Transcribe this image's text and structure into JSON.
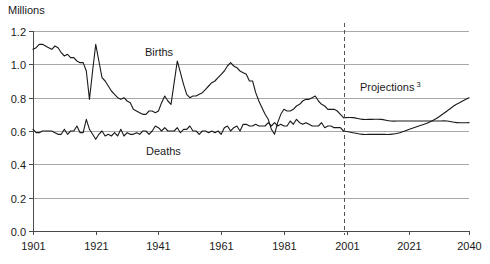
{
  "chart_data": {
    "type": "line",
    "title": "",
    "ylabel": "Millions",
    "xlabel": "",
    "ylim": [
      0.0,
      1.2
    ],
    "xlim": [
      1901,
      2040
    ],
    "grid": true,
    "legend_position": "inline-annotations",
    "y_ticks": [
      "0.0",
      "0.2",
      "0.4",
      "0.6",
      "0.8",
      "1.0",
      "1.2"
    ],
    "y_tick_values": [
      0.0,
      0.2,
      0.4,
      0.6,
      0.8,
      1.0,
      1.2
    ],
    "x_ticks": [
      "1901",
      "1921",
      "1941",
      "1961",
      "1981",
      "2001",
      "2021",
      "2040"
    ],
    "x_tick_values": [
      1901,
      1921,
      1941,
      1961,
      1981,
      2001,
      2021,
      2040
    ],
    "annotations": [
      {
        "text": "Births",
        "x": 1945,
        "y": 1.06
      },
      {
        "text": "Deaths",
        "x": 1942,
        "y": 0.47
      },
      {
        "text": "Projections",
        "superscript": "3",
        "x": 2008,
        "y": 0.83
      }
    ],
    "projection_divider": {
      "x": 2000,
      "style": "dashed"
    },
    "series": [
      {
        "name": "Births",
        "color": "#1a1a1a",
        "x": [
          1901,
          1902,
          1903,
          1904,
          1905,
          1906,
          1907,
          1908,
          1909,
          1910,
          1911,
          1912,
          1913,
          1914,
          1915,
          1916,
          1917,
          1918,
          1919,
          1920,
          1921,
          1922,
          1923,
          1924,
          1925,
          1926,
          1927,
          1928,
          1929,
          1930,
          1931,
          1932,
          1933,
          1934,
          1935,
          1936,
          1937,
          1938,
          1939,
          1940,
          1941,
          1942,
          1943,
          1944,
          1945,
          1946,
          1947,
          1948,
          1949,
          1950,
          1951,
          1952,
          1953,
          1954,
          1955,
          1956,
          1957,
          1958,
          1959,
          1960,
          1961,
          1962,
          1963,
          1964,
          1965,
          1966,
          1967,
          1968,
          1969,
          1970,
          1971,
          1972,
          1973,
          1974,
          1975,
          1976,
          1977,
          1978,
          1979,
          1980,
          1981,
          1982,
          1983,
          1984,
          1985,
          1986,
          1987,
          1988,
          1989,
          1990,
          1991,
          1992,
          1993,
          1994,
          1995,
          1996,
          1997,
          1998,
          1999,
          2000
        ],
        "values": [
          1.09,
          1.1,
          1.12,
          1.12,
          1.11,
          1.1,
          1.09,
          1.11,
          1.1,
          1.07,
          1.05,
          1.06,
          1.04,
          1.04,
          1.02,
          1.01,
          1.01,
          0.96,
          0.79,
          0.96,
          1.12,
          1.02,
          0.92,
          0.9,
          0.87,
          0.84,
          0.82,
          0.8,
          0.79,
          0.8,
          0.78,
          0.77,
          0.73,
          0.72,
          0.71,
          0.7,
          0.7,
          0.72,
          0.72,
          0.71,
          0.72,
          0.77,
          0.81,
          0.78,
          0.76,
          0.89,
          1.02,
          0.95,
          0.88,
          0.82,
          0.8,
          0.81,
          0.81,
          0.82,
          0.83,
          0.85,
          0.87,
          0.89,
          0.9,
          0.92,
          0.94,
          0.96,
          0.99,
          1.01,
          0.99,
          0.98,
          0.96,
          0.95,
          0.94,
          0.9,
          0.9,
          0.83,
          0.78,
          0.74,
          0.7,
          0.67,
          0.61,
          0.58,
          0.65,
          0.7,
          0.73,
          0.72,
          0.72,
          0.73,
          0.75,
          0.76,
          0.78,
          0.79,
          0.79,
          0.8,
          0.81,
          0.78,
          0.76,
          0.75,
          0.73,
          0.73,
          0.73,
          0.72,
          0.7,
          0.68
        ]
      },
      {
        "name": "Deaths",
        "color": "#1a1a1a",
        "x": [
          1901,
          1902,
          1903,
          1904,
          1905,
          1906,
          1907,
          1908,
          1909,
          1910,
          1911,
          1912,
          1913,
          1914,
          1915,
          1916,
          1917,
          1918,
          1919,
          1920,
          1921,
          1922,
          1923,
          1924,
          1925,
          1926,
          1927,
          1928,
          1929,
          1930,
          1931,
          1932,
          1933,
          1934,
          1935,
          1936,
          1937,
          1938,
          1939,
          1940,
          1941,
          1942,
          1943,
          1944,
          1945,
          1946,
          1947,
          1948,
          1949,
          1950,
          1951,
          1952,
          1953,
          1954,
          1955,
          1956,
          1957,
          1958,
          1959,
          1960,
          1961,
          1962,
          1963,
          1964,
          1965,
          1966,
          1967,
          1968,
          1969,
          1970,
          1971,
          1972,
          1973,
          1974,
          1975,
          1976,
          1977,
          1978,
          1979,
          1980,
          1981,
          1982,
          1983,
          1984,
          1985,
          1986,
          1987,
          1988,
          1989,
          1990,
          1991,
          1992,
          1993,
          1994,
          1995,
          1996,
          1997,
          1998,
          1999,
          2000
        ],
        "values": [
          0.61,
          0.59,
          0.59,
          0.6,
          0.6,
          0.6,
          0.6,
          0.59,
          0.58,
          0.58,
          0.61,
          0.58,
          0.6,
          0.6,
          0.63,
          0.59,
          0.59,
          0.67,
          0.61,
          0.58,
          0.55,
          0.58,
          0.6,
          0.57,
          0.58,
          0.57,
          0.59,
          0.57,
          0.61,
          0.57,
          0.59,
          0.58,
          0.58,
          0.59,
          0.58,
          0.6,
          0.6,
          0.58,
          0.6,
          0.63,
          0.62,
          0.6,
          0.62,
          0.6,
          0.6,
          0.6,
          0.62,
          0.59,
          0.61,
          0.61,
          0.63,
          0.6,
          0.6,
          0.58,
          0.6,
          0.6,
          0.59,
          0.6,
          0.59,
          0.6,
          0.58,
          0.62,
          0.63,
          0.6,
          0.62,
          0.63,
          0.6,
          0.64,
          0.64,
          0.63,
          0.63,
          0.64,
          0.63,
          0.63,
          0.63,
          0.65,
          0.63,
          0.65,
          0.63,
          0.64,
          0.63,
          0.63,
          0.66,
          0.64,
          0.67,
          0.65,
          0.64,
          0.65,
          0.64,
          0.63,
          0.63,
          0.63,
          0.65,
          0.62,
          0.63,
          0.63,
          0.62,
          0.62,
          0.62,
          0.6
        ]
      },
      {
        "name": "Births projection",
        "color": "#1a1a1a",
        "projection": true,
        "x": [
          2000,
          2003,
          2006,
          2009,
          2012,
          2015,
          2018,
          2021,
          2024,
          2027,
          2030,
          2033,
          2036,
          2040
        ],
        "values": [
          0.68,
          0.68,
          0.67,
          0.67,
          0.67,
          0.66,
          0.66,
          0.66,
          0.66,
          0.66,
          0.66,
          0.66,
          0.65,
          0.65
        ]
      },
      {
        "name": "Deaths projection",
        "color": "#1a1a1a",
        "projection": true,
        "x": [
          2000,
          2003,
          2006,
          2009,
          2012,
          2015,
          2018,
          2021,
          2024,
          2027,
          2030,
          2033,
          2036,
          2040
        ],
        "values": [
          0.6,
          0.59,
          0.58,
          0.58,
          0.58,
          0.58,
          0.59,
          0.61,
          0.63,
          0.65,
          0.68,
          0.72,
          0.76,
          0.8
        ]
      }
    ]
  }
}
